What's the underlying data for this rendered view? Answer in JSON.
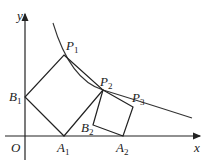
{
  "diagram": {
    "axes": {
      "x_label": "x",
      "y_label": "y",
      "origin_label": "O"
    },
    "points": [
      {
        "name": "P",
        "sub": "1",
        "x": 64,
        "y": 55,
        "lx": 66,
        "ly": 50
      },
      {
        "name": "P",
        "sub": "2",
        "x": 103,
        "y": 90,
        "lx": 100,
        "ly": 86
      },
      {
        "name": "P",
        "sub": "3",
        "x": 133,
        "y": 107,
        "lx": 132,
        "ly": 102
      },
      {
        "name": "B",
        "sub": "1",
        "x": 25,
        "y": 97,
        "lx": 9,
        "ly": 101
      },
      {
        "name": "B",
        "sub": "2",
        "x": 93,
        "y": 125,
        "lx": 81,
        "ly": 132
      },
      {
        "name": "A",
        "sub": "1",
        "x": 64,
        "y": 136,
        "lx": 57,
        "ly": 152
      },
      {
        "name": "A",
        "sub": "2",
        "x": 123,
        "y": 136,
        "lx": 116,
        "ly": 152
      }
    ]
  }
}
